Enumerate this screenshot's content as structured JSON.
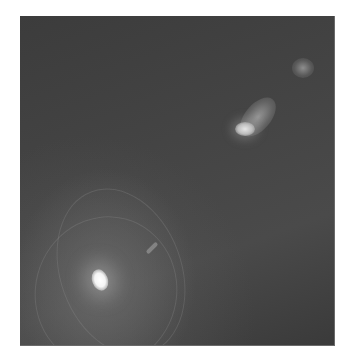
{
  "image": {
    "description": "Grayscale astronomical photograph of a bright galactic nucleus with a jet extending to the upper right",
    "colors": {
      "background": "#ffffff",
      "sky": "#404040",
      "nucleus": "#ffffff",
      "jet": "#bdbdbd"
    }
  }
}
